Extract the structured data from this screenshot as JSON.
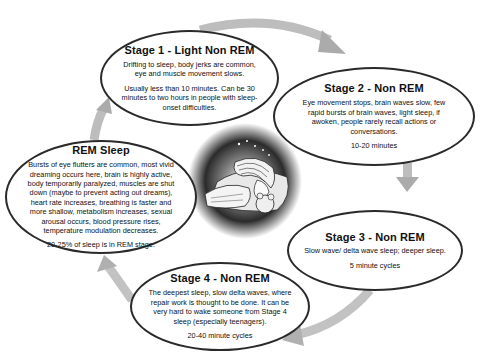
{
  "diagram": {
    "type": "cycle",
    "center_image": "sleeping-woman-illustration",
    "stages": {
      "stage1": {
        "title": "Stage 1  -  Light Non REM",
        "description": "Drifting to sleep, body jerks are common, eye and muscle movement slows.",
        "duration": "Usually less than 10 minutes. Can be 30 minutes to two hours in people with sleep-onset difficulties."
      },
      "stage2": {
        "title": "Stage 2  -  Non REM",
        "description": "Eye movement stops, brain waves slow, few rapid bursts of brain waves, light sleep, if awoken, people rarely recall actions or conversations.",
        "duration": "10-20 minutes"
      },
      "stage3": {
        "title": "Stage 3  -  Non REM",
        "description": "Slow wave/ delta wave sleep; deeper sleep.",
        "duration": "5 minute cycles"
      },
      "stage4": {
        "title": "Stage 4  -  Non REM",
        "description": "The deepest sleep, slow delta waves, where repair work is thought to be done.  It can be very hard to wake someone from Stage 4 sleep (especially teenagers).",
        "duration": "20-40 minute cycles"
      },
      "rem": {
        "title": "REM Sleep",
        "description": "Bursts of eye flutters are common, most vivid dreaming occurs here, brain is highly active, body temporarily paralyzed, muscles are shut down (maybe to prevent acting out dreams), heart rate increases, breathing is faster and more shallow, metabolism increases, sexual arousal occurs, blood pressure rises, temperature modulation decreases.",
        "duration": "20-25% of sleep is in REM stage."
      }
    },
    "flow": [
      "stage1",
      "stage2",
      "stage3",
      "stage4",
      "rem",
      "stage1"
    ],
    "colors": {
      "outline": "#2a2a2a",
      "arrow": "#b5b5b5",
      "background": "#ffffff"
    }
  }
}
